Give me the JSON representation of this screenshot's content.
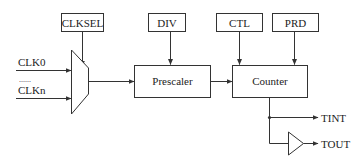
{
  "diagram": {
    "title": "",
    "control_boxes": {
      "clksel": "CLKSEL",
      "div": "DIV",
      "ctl": "CTL",
      "prd": "PRD"
    },
    "inputs": {
      "first": "CLK0",
      "ellipsis": "......",
      "last": "CLKn"
    },
    "blocks": {
      "mux": "",
      "prescaler": "Prescaler",
      "counter": "Counter",
      "buffer": ""
    },
    "outputs": {
      "tint": "TINT",
      "tout": "TOUT"
    },
    "colors": {
      "stroke": "#333333",
      "text": "#222222",
      "background": "#ffffff"
    }
  }
}
